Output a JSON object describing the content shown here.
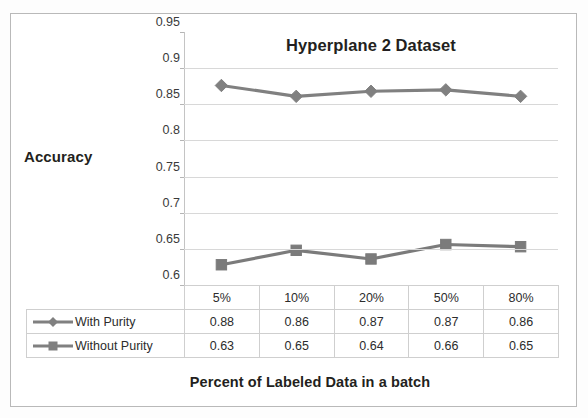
{
  "chart_data": {
    "type": "line",
    "title": "Hyperplane 2 Dataset",
    "xlabel": "Percent of Labeled Data in a batch",
    "ylabel": "Accuracy",
    "categories": [
      "5%",
      "10%",
      "20%",
      "50%",
      "80%"
    ],
    "ylim": [
      0.6,
      0.95
    ],
    "ystep": 0.05,
    "ytick_labels": [
      "0.95",
      "0.9",
      "0.85",
      "0.8",
      "0.75",
      "0.7",
      "0.65",
      "0.6"
    ],
    "ytick_values": [
      0.95,
      0.9,
      0.85,
      0.8,
      0.75,
      0.7,
      0.65,
      0.6
    ],
    "grid": "horizontal",
    "legend_position": "data-table",
    "series": [
      {
        "name": "With Purity",
        "marker": "diamond",
        "color": "#808080",
        "values": [
          0.88,
          0.86,
          0.87,
          0.87,
          0.86
        ],
        "plotted_values": [
          0.876,
          0.861,
          0.868,
          0.87,
          0.861
        ],
        "labels": [
          "0.88",
          "0.86",
          "0.87",
          "0.87",
          "0.86"
        ]
      },
      {
        "name": "Without Purity",
        "marker": "square",
        "color": "#7b7b7b",
        "values": [
          0.63,
          0.65,
          0.64,
          0.66,
          0.65
        ],
        "plotted_values": [
          0.628,
          0.648,
          0.636,
          0.656,
          0.653
        ],
        "labels": [
          "0.63",
          "0.65",
          "0.64",
          "0.66",
          "0.65"
        ]
      }
    ]
  },
  "table": {
    "header_row": [
      "5%",
      "10%",
      "20%",
      "50%",
      "80%"
    ],
    "rows": [
      {
        "label": "With Purity",
        "marker": "diamond",
        "cells": [
          "0.88",
          "0.86",
          "0.87",
          "0.87",
          "0.86"
        ]
      },
      {
        "label": "Without Purity",
        "marker": "square",
        "cells": [
          "0.63",
          "0.65",
          "0.64",
          "0.66",
          "0.65"
        ]
      }
    ]
  },
  "colors": {
    "series_line": "#808080",
    "gridline": "#d8d8d8",
    "axis": "#c4c4c4",
    "table_border": "#cfcfcf",
    "frame": "#b9b9b9",
    "text": "#231f20"
  }
}
